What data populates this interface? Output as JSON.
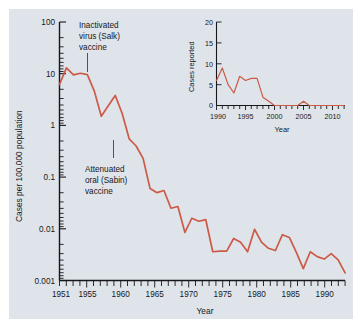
{
  "figure": {
    "background_color": "#dfe4ea",
    "page_color": "#ffffff"
  },
  "chart_data": [
    {
      "id": "main",
      "type": "line",
      "title": "",
      "xlabel": "Year",
      "ylabel": "Cases per 100,000 population",
      "yscale": "log",
      "xlim": [
        1951,
        1992
      ],
      "ylim": [
        0.001,
        100
      ],
      "grid": false,
      "legend": "none",
      "line_color": "#cc5a47",
      "ytick_labels": [
        "100",
        "10",
        "1",
        "0.1",
        "0.01",
        "0.001"
      ],
      "ytick_values": [
        100,
        10,
        1,
        0.1,
        0.01,
        0.001
      ],
      "xtick_labels": [
        "1951",
        "1955",
        "1960",
        "1965",
        "1970",
        "1975",
        "1980",
        "1985",
        "1990"
      ],
      "xtick_values": [
        1951,
        1955,
        1960,
        1965,
        1970,
        1975,
        1980,
        1985,
        1990
      ],
      "x": [
        1951,
        1952,
        1953,
        1954,
        1955,
        1956,
        1957,
        1958,
        1959,
        1960,
        1961,
        1962,
        1963,
        1964,
        1965,
        1966,
        1967,
        1968,
        1969,
        1970,
        1971,
        1972,
        1973,
        1974,
        1975,
        1976,
        1977,
        1978,
        1979,
        1980,
        1981,
        1982,
        1983,
        1984,
        1985,
        1986,
        1987,
        1988,
        1989,
        1990,
        1991,
        1992
      ],
      "values": [
        6.2,
        13.0,
        9.5,
        10.2,
        9.6,
        4.6,
        1.5,
        2.4,
        3.8,
        1.7,
        0.55,
        0.4,
        0.23,
        0.06,
        0.05,
        0.055,
        0.025,
        0.027,
        0.0085,
        0.016,
        0.014,
        0.015,
        0.0036,
        0.0037,
        0.0037,
        0.0065,
        0.0055,
        0.0036,
        0.0098,
        0.0055,
        0.0042,
        0.0038,
        0.0077,
        0.0068,
        0.0035,
        0.0017,
        0.0036,
        0.0029,
        0.0026,
        0.0033,
        0.0025,
        0.0014
      ],
      "annotations": [
        {
          "id": "salk",
          "text": [
            "Inactivated",
            "virus (Salk)",
            "vaccine"
          ],
          "points_to_year": 1955
        },
        {
          "id": "sabin",
          "text": [
            "Attenuated",
            "oral (Sabin)",
            "vaccine"
          ],
          "points_to_year": 1961
        }
      ]
    },
    {
      "id": "inset",
      "type": "line",
      "title": "",
      "xlabel": "Year",
      "ylabel": "Cases reported",
      "yscale": "linear",
      "xlim": [
        1990,
        2012
      ],
      "ylim": [
        0,
        20
      ],
      "grid": false,
      "legend": "none",
      "line_color": "#cc5a47",
      "ytick_labels": [
        "20",
        "15",
        "10",
        "5",
        "0"
      ],
      "ytick_values": [
        20,
        15,
        10,
        5,
        0
      ],
      "xtick_labels": [
        "1990",
        "1995",
        "2000",
        "2005",
        "2010"
      ],
      "xtick_values": [
        1990,
        1995,
        2000,
        2005,
        2010
      ],
      "x": [
        1990,
        1991,
        1992,
        1993,
        1994,
        1995,
        1996,
        1997,
        1998,
        1999,
        2000,
        2001,
        2002,
        2003,
        2004,
        2005,
        2006,
        2007,
        2008,
        2009,
        2010,
        2011,
        2012
      ],
      "values": [
        6,
        9,
        5,
        3,
        7,
        6,
        6.5,
        6.5,
        2,
        1,
        0,
        0,
        0,
        0,
        0,
        1,
        0,
        0,
        0,
        0,
        0,
        0,
        0
      ]
    }
  ]
}
